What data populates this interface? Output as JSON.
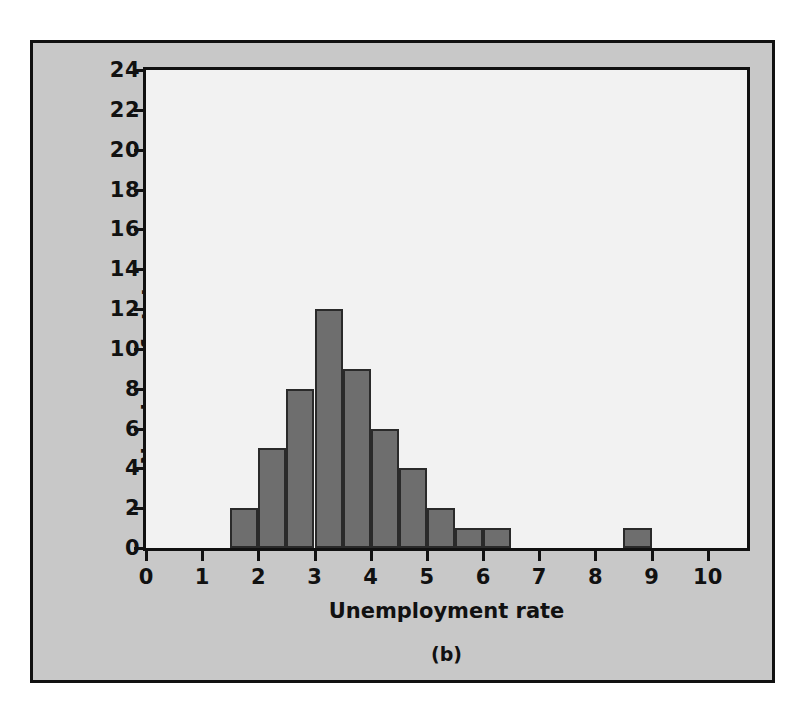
{
  "figure": {
    "caption": "(b)",
    "panel_bg": "#c8c8c8",
    "plot_bg": "#f2f2f2",
    "bar_fill": "#6e6e6e",
    "bar_stroke": "#2a2a2a",
    "axis_color": "#111111"
  },
  "chart_data": {
    "type": "bar",
    "title": "",
    "subtitle": "",
    "xlabel": "Unemployment rate",
    "ylabel": "Number of states",
    "xlim": [
      0,
      10.7
    ],
    "ylim": [
      0,
      24
    ],
    "xticks": [
      0,
      1,
      2,
      3,
      4,
      5,
      6,
      7,
      8,
      9,
      10
    ],
    "xtick_labels": [
      "0",
      "1",
      "2",
      "3",
      "4",
      "5",
      "6",
      "7",
      "8",
      "9",
      "10"
    ],
    "yticks": [
      0,
      2,
      4,
      6,
      8,
      10,
      12,
      14,
      16,
      18,
      20,
      22,
      24
    ],
    "ytick_labels": [
      "0",
      "2",
      "4",
      "6",
      "8",
      "10",
      "12",
      "14",
      "16",
      "18",
      "20",
      "22",
      "24"
    ],
    "grid": false,
    "legend": null,
    "bin_width": 0.5,
    "bins": [
      {
        "start": 1.5,
        "end": 2.0,
        "count": 2
      },
      {
        "start": 2.0,
        "end": 2.5,
        "count": 5
      },
      {
        "start": 2.5,
        "end": 3.0,
        "count": 8
      },
      {
        "start": 3.0,
        "end": 3.5,
        "count": 12
      },
      {
        "start": 3.5,
        "end": 4.0,
        "count": 9
      },
      {
        "start": 4.0,
        "end": 4.5,
        "count": 6
      },
      {
        "start": 4.5,
        "end": 5.0,
        "count": 4
      },
      {
        "start": 5.0,
        "end": 5.5,
        "count": 2
      },
      {
        "start": 5.5,
        "end": 6.0,
        "count": 1
      },
      {
        "start": 6.0,
        "end": 6.5,
        "count": 1
      },
      {
        "start": 8.5,
        "end": 9.0,
        "count": 1
      }
    ],
    "categories": [
      "1.5-2.0",
      "2.0-2.5",
      "2.5-3.0",
      "3.0-3.5",
      "3.5-4.0",
      "4.0-4.5",
      "4.5-5.0",
      "5.0-5.5",
      "5.5-6.0",
      "6.0-6.5",
      "8.5-9.0"
    ],
    "values": [
      2,
      5,
      8,
      12,
      9,
      6,
      4,
      2,
      1,
      1,
      1
    ]
  }
}
